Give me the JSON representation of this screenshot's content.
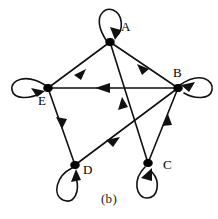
{
  "figure": {
    "caption": "(b)",
    "type": "directed-graph-digraph",
    "background_color": "#ffffff",
    "ink_color": "#111111"
  },
  "graph": {
    "nodes": [
      {
        "id": "A",
        "label": "A",
        "x": 110,
        "y": 42,
        "label_x": 121,
        "label_y": 20
      },
      {
        "id": "B",
        "label": "B",
        "x": 178,
        "y": 88,
        "label_x": 173,
        "label_y": 66
      },
      {
        "id": "C",
        "label": "C",
        "x": 148,
        "y": 163,
        "label_x": 163,
        "label_y": 158
      },
      {
        "id": "D",
        "label": "D",
        "x": 75,
        "y": 165,
        "label_x": 83,
        "label_y": 163
      },
      {
        "id": "E",
        "label": "E",
        "x": 48,
        "y": 88,
        "label_x": 40,
        "label_y": 94
      }
    ],
    "edges": [
      {
        "from": "A",
        "to": "E",
        "arrow_at": "E"
      },
      {
        "from": "A",
        "to": "B",
        "arrow_at": "B"
      },
      {
        "from": "B",
        "to": "E",
        "arrow_at": "E"
      },
      {
        "from": "E",
        "to": "D",
        "arrow_at": "D"
      },
      {
        "from": "B",
        "to": "D",
        "arrow_at": "D"
      },
      {
        "from": "C",
        "to": "B",
        "arrow_at": "B"
      },
      {
        "from": "C",
        "to": "A",
        "arrow_at": "A"
      }
    ],
    "self_loops": [
      {
        "node": "A",
        "direction": "above"
      },
      {
        "node": "B",
        "direction": "right"
      },
      {
        "node": "C",
        "direction": "below"
      },
      {
        "node": "D",
        "direction": "below-left"
      },
      {
        "node": "E",
        "direction": "left"
      }
    ]
  }
}
